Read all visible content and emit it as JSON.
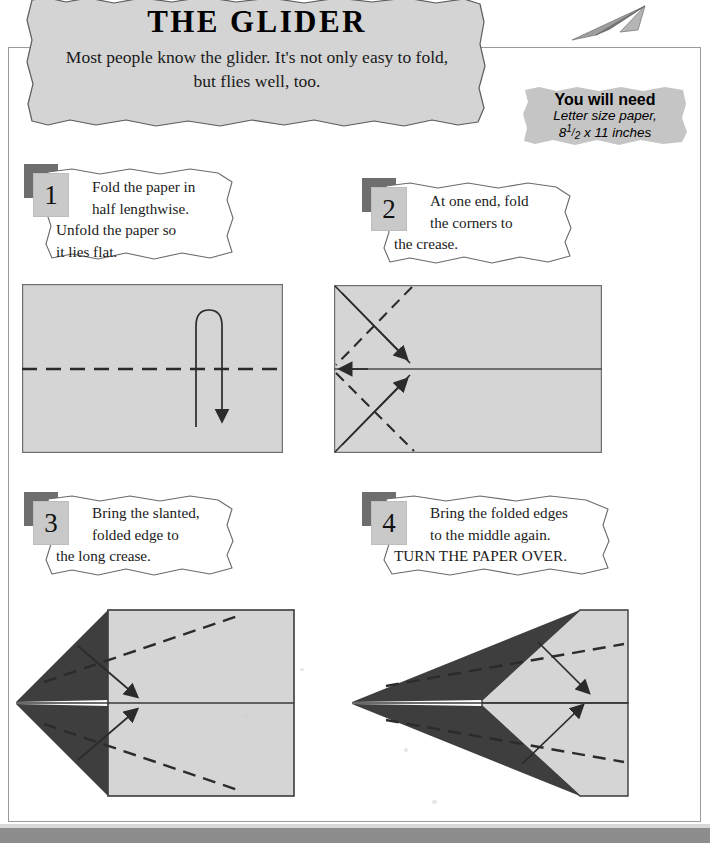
{
  "header": {
    "title": "THE GLIDER",
    "subtitle": "Most people know the glider. It's not only easy to fold, but flies well, too.",
    "plane_icon": "paper-airplane-icon"
  },
  "materials": {
    "heading": "You will need",
    "line1": "Letter size paper,",
    "line2_prefix": "8",
    "line2_num": "1",
    "line2_den": "2",
    "line2_suffix": " x 11 inches"
  },
  "steps": [
    {
      "number": "1",
      "lines": [
        "Fold the paper in",
        "half lengthwise.",
        "Unfold the paper so",
        "it lies flat."
      ]
    },
    {
      "number": "2",
      "lines": [
        "At one end, fold",
        "the corners to",
        "the crease.",
        ""
      ]
    },
    {
      "number": "3",
      "lines": [
        "Bring the slanted,",
        "folded edge to",
        "the long crease.",
        ""
      ]
    },
    {
      "number": "4",
      "lines": [
        "Bring the folded edges",
        "to the middle again.",
        "TURN THE PAPER OVER.",
        ""
      ]
    }
  ],
  "diagrams": [
    {
      "name": "diagram-step-1",
      "caption": "flat sheet with horizontal dashed center crease and fold-over arrow"
    },
    {
      "name": "diagram-step-2",
      "caption": "sheet with solid center crease, corners folded to crease along diagonals"
    },
    {
      "name": "diagram-step-3",
      "caption": "dart with dark triangular flaps, dashed lines and arrows to center crease"
    },
    {
      "name": "diagram-step-4",
      "caption": "narrower dart with folded edges brought to middle again"
    }
  ],
  "colors": {
    "paper_fill": "#d5d5d5",
    "flap_dark": "#3e3e3e",
    "banner_fill": "#d4d4d4",
    "badge_fill": "#c9c9c9",
    "badge_shadow": "#6e6e6e",
    "frame_line": "#9a9a9a",
    "bottom_band": "#8d8d8d"
  }
}
